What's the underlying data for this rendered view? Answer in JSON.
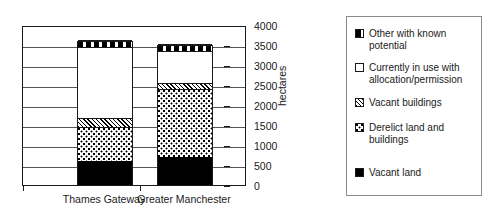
{
  "chart_data": {
    "type": "bar",
    "subtype": "stacked",
    "title": "",
    "xlabel": "",
    "ylabel": "hectares",
    "ylim": [
      0,
      4000
    ],
    "ytick_step": 500,
    "yticks": [
      "0",
      "500",
      "1000",
      "1500",
      "2000",
      "2500",
      "3000",
      "3500",
      "4000"
    ],
    "grid": true,
    "legend_position": "right",
    "categories": [
      "Thames Gateway",
      "Greater Manchester"
    ],
    "series": [
      {
        "name": "Vacant land",
        "pattern": "solid-black",
        "values": [
          600,
          690
        ]
      },
      {
        "name": "Derelict land and buildings",
        "pattern": "dotted",
        "values": [
          850,
          1710
        ]
      },
      {
        "name": "Vacant buildings",
        "pattern": "diagonal-hatch",
        "values": [
          220,
          150
        ]
      },
      {
        "name": "Currently in use with allocation/permission",
        "pattern": "white",
        "values": [
          1780,
          800
        ]
      },
      {
        "name": "Other with known potential",
        "pattern": "horizontal-dashes",
        "values": [
          150,
          150
        ]
      }
    ],
    "totals": [
      3600,
      3500
    ]
  },
  "legend": {
    "items": [
      {
        "label": "Other with known potential",
        "swatch": "dash-swatch"
      },
      {
        "label": "Currently in use with allocation/permission",
        "swatch": "white-swatch"
      },
      {
        "label": "Vacant buildings",
        "swatch": "hatch-swatch"
      },
      {
        "label": "Derelict land and buildings",
        "swatch": "dots-swatch"
      },
      {
        "label": "Vacant land",
        "swatch": "black-swatch"
      }
    ]
  }
}
